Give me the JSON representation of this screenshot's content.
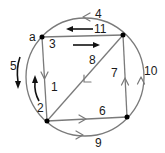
{
  "diagram": {
    "type": "directed-graph",
    "colors": {
      "edge": "#7a7a7a",
      "vertex": "#000000",
      "label": "#1a1a1a",
      "traversal_arrow": "#111111"
    },
    "vertices": [
      {
        "id": "a",
        "label": "a",
        "position": "top-left"
      },
      {
        "id": "b",
        "label": "",
        "position": "top-right"
      },
      {
        "id": "c",
        "label": "",
        "position": "bottom-left"
      },
      {
        "id": "d",
        "label": "",
        "position": "bottom-right"
      }
    ],
    "edges": [
      {
        "id": "1",
        "label": "1",
        "from": "a",
        "to": "c",
        "kind": "straight"
      },
      {
        "id": "2",
        "label": "2",
        "from": "c",
        "to": "a",
        "kind": "traversal-arrow"
      },
      {
        "id": "3",
        "label": "3",
        "from": "a",
        "to": "b",
        "kind": "straight"
      },
      {
        "id": "4",
        "label": "4",
        "from": "b",
        "to": "a",
        "kind": "arc-top"
      },
      {
        "id": "5",
        "label": "5",
        "from": "a",
        "to": "c",
        "kind": "arc-left"
      },
      {
        "id": "6",
        "label": "6",
        "from": "c",
        "to": "d",
        "kind": "straight"
      },
      {
        "id": "7",
        "label": "7",
        "from": "d",
        "to": "b",
        "kind": "straight"
      },
      {
        "id": "8",
        "label": "8",
        "from": "b",
        "to": "c",
        "kind": "diagonal"
      },
      {
        "id": "9",
        "label": "9",
        "from": "c",
        "to": "d",
        "kind": "arc-bottom"
      },
      {
        "id": "10",
        "label": "10",
        "from": "d",
        "to": "b",
        "kind": "arc-right"
      },
      {
        "id": "11",
        "label": "11",
        "from": "b",
        "to": "a",
        "kind": "traversal-arrow"
      }
    ]
  }
}
